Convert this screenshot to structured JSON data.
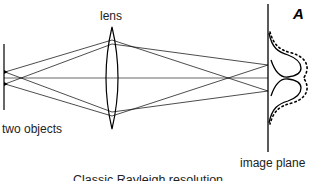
{
  "diagram": {
    "panel_label": "A",
    "labels": {
      "lens": "lens",
      "objects": "two objects",
      "image_plane": "image plane",
      "caption": "Classic Rayleigh resolution"
    },
    "elements": [
      "object plane",
      "two point objects",
      "biconvex lens",
      "optical axis",
      "ray paths",
      "image plane",
      "two Airy-like intensity profiles",
      "dotted summed profile"
    ],
    "colors": {
      "line": "#000000",
      "text": "#222222",
      "background": "#ffffff"
    }
  }
}
